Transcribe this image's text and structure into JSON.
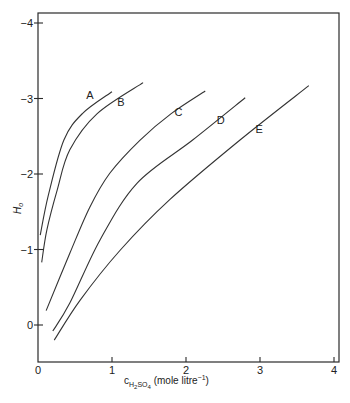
{
  "chart_data": {
    "type": "line",
    "title": "",
    "xlabel": "c_H2SO4 (mole litre^-1)",
    "xlabel_parts": {
      "main": "c",
      "sub": "H",
      "sub2": "2",
      "sub3": "SO",
      "sub4": "4",
      "rest": " (mole litre",
      "sup": "−1",
      "close": ")"
    },
    "ylabel": "H0",
    "ylabel_parts": {
      "main": "H",
      "sub": "o"
    },
    "xlim": [
      0,
      4
    ],
    "ylim": [
      0.4,
      -4.2
    ],
    "y_axis_inverted": true,
    "grid": false,
    "legend": "inline curve labels",
    "x_ticks": [
      0,
      1,
      2,
      3,
      4
    ],
    "x_tick_labels": [
      "0",
      "1",
      "2",
      "3",
      "4"
    ],
    "y_ticks": [
      0,
      -1,
      -2,
      -3,
      -4
    ],
    "y_tick_labels": [
      "0",
      "−1",
      "−2",
      "−3",
      "−4"
    ],
    "series": [
      {
        "name": "A",
        "x": [
          0.03,
          0.14,
          0.35,
          0.6,
          1.0
        ],
        "y": [
          -1.19,
          -1.72,
          -2.45,
          -2.8,
          -3.09
        ],
        "label_pos": [
          0.7,
          -3.0
        ]
      },
      {
        "name": "B",
        "x": [
          0.05,
          0.12,
          0.26,
          0.43,
          0.8,
          1.42
        ],
        "y": [
          -0.83,
          -1.26,
          -1.79,
          -2.32,
          -2.8,
          -3.21
        ],
        "label_pos": [
          1.12,
          -2.9
        ]
      },
      {
        "name": "C",
        "x": [
          0.11,
          0.43,
          0.7,
          0.97,
          1.38,
          1.8,
          2.26
        ],
        "y": [
          -0.19,
          -0.95,
          -1.56,
          -2.01,
          -2.45,
          -2.8,
          -3.1
        ],
        "label_pos": [
          1.9,
          -2.77
        ]
      },
      {
        "name": "D",
        "x": [
          0.2,
          0.43,
          0.84,
          1.34,
          2.09,
          2.8
        ],
        "y": [
          0.08,
          -0.29,
          -1.13,
          -1.88,
          -2.45,
          -3.01
        ],
        "label_pos": [
          2.47,
          -2.66
        ]
      },
      {
        "name": "E",
        "x": [
          0.22,
          0.57,
          1.11,
          1.78,
          2.73,
          3.66
        ],
        "y": [
          0.2,
          -0.33,
          -0.99,
          -1.66,
          -2.45,
          -3.17
        ],
        "label_pos": [
          2.99,
          -2.54
        ]
      }
    ]
  }
}
